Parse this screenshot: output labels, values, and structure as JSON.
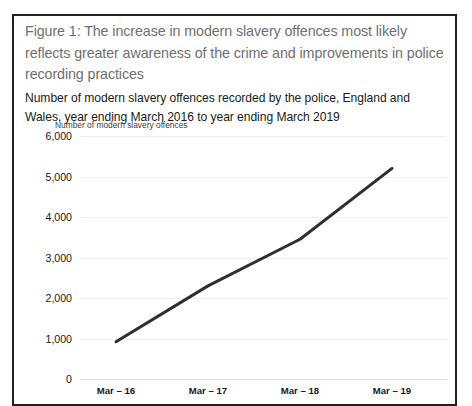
{
  "figure": {
    "title": "Figure 1: The increase in modern slavery offences most likely reflects greater awareness of the crime and improvements in police recording practices",
    "subtitle": "Number of modern slavery offences recorded by the police, England and Wales, year ending March 2016 to year ending March 2019",
    "border_color": "#231f20",
    "title_color": "#6f6f6f"
  },
  "chart_data": {
    "type": "line",
    "title": "",
    "subtitle": "",
    "ylabel": "Number of modern slavery offences",
    "xlabel": "",
    "categories": [
      "Mar – 16",
      "Mar – 17",
      "Mar – 18",
      "Mar – 19"
    ],
    "values": [
      920,
      2300,
      3450,
      5200
    ],
    "series": [
      {
        "name": "Number of modern slavery offences",
        "values": [
          920,
          2300,
          3450,
          5200
        ]
      }
    ],
    "ylim": [
      0,
      6000
    ],
    "yticks": [
      0,
      1000,
      2000,
      3000,
      4000,
      5000,
      6000
    ],
    "ytick_labels": [
      "0",
      "1,000",
      "2,000",
      "3,000",
      "4,000",
      "5,000",
      "6,000"
    ],
    "grid": true,
    "legend": false,
    "line_color": "#2f2f2f",
    "line_width": 3,
    "gridline_color": "#ededed"
  }
}
